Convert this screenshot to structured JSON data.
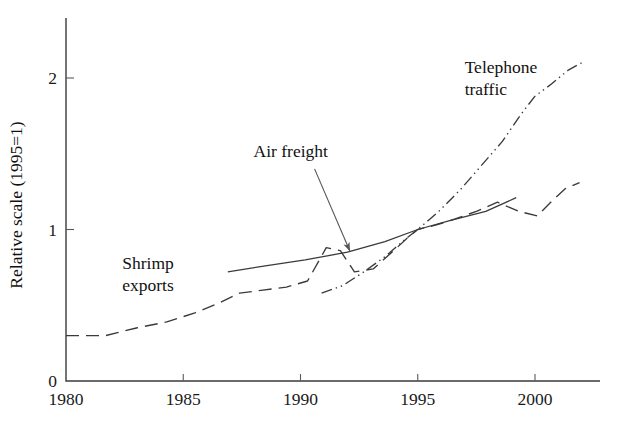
{
  "chart_data": {
    "type": "line",
    "title": "",
    "subtitle": "",
    "xlabel": "",
    "ylabel": "Relative scale (1995=1)",
    "xlim": [
      1980,
      2002.2
    ],
    "ylim": [
      0,
      2.3
    ],
    "x_ticks": [
      1980,
      1985,
      1990,
      1995,
      2000
    ],
    "x_tick_labels": [
      "1980",
      "1985",
      "1990",
      "1995",
      "2000"
    ],
    "y_ticks": [
      0,
      1,
      2
    ],
    "y_tick_labels": [
      "0",
      "1",
      "2"
    ],
    "grid": false,
    "legend_position": "inline-annotations",
    "series": [
      {
        "name": "Shrimp exports",
        "style": "dashed",
        "color": "#3a3a3a",
        "label_text": "Shrimp\nexports",
        "label_line1": "Shrimp",
        "label_line2": "exports",
        "label_x": 1982.4,
        "label_y": 0.74,
        "x": [
          1980.0,
          1981.7,
          1983.0,
          1984.3,
          1985.5,
          1986.6,
          1987.4,
          1988.4,
          1989.4,
          1990.3,
          1991.1,
          1991.7,
          1992.3,
          1993.1,
          1993.9,
          1994.6,
          1995.0,
          1995.8,
          1996.6,
          1997.5,
          1998.4,
          1999.3,
          2000.1,
          2000.8,
          2001.3,
          2001.9
        ],
        "y": [
          0.3,
          0.3,
          0.35,
          0.39,
          0.45,
          0.52,
          0.58,
          0.6,
          0.62,
          0.66,
          0.88,
          0.86,
          0.72,
          0.74,
          0.85,
          0.95,
          1.0,
          1.03,
          1.07,
          1.12,
          1.18,
          1.12,
          1.09,
          1.2,
          1.27,
          1.31
        ]
      },
      {
        "name": "Air freight",
        "style": "solid",
        "color": "#3a3a3a",
        "label_text": "Air freight",
        "label_x": 1988.0,
        "label_y": 1.48,
        "x": [
          1986.9,
          1988.5,
          1990.2,
          1992.0,
          1993.6,
          1995.0,
          1996.4,
          1997.9,
          1999.2
        ],
        "y": [
          0.72,
          0.76,
          0.8,
          0.85,
          0.92,
          1.0,
          1.06,
          1.12,
          1.21
        ]
      },
      {
        "name": "Telephone traffic",
        "style": "dash-dot-dot",
        "color": "#3a3a3a",
        "label_text": "Telephone\ntraffic",
        "label_line1": "Telephone",
        "label_line2": "traffic",
        "label_x": 1997.0,
        "label_y": 2.03,
        "x": [
          1990.9,
          1991.8,
          1992.7,
          1993.6,
          1994.5,
          1995.0,
          1995.9,
          1996.8,
          1997.7,
          1998.6,
          1999.4,
          2000.0,
          2000.7,
          2001.4,
          2002.1
        ],
        "y": [
          0.58,
          0.63,
          0.72,
          0.82,
          0.94,
          1.0,
          1.12,
          1.26,
          1.42,
          1.58,
          1.76,
          1.88,
          1.96,
          2.05,
          2.11
        ]
      }
    ],
    "annotations": [
      {
        "name": "air-freight-leader",
        "from_x": 1990.6,
        "from_y": 1.4,
        "to_x": 1992.1,
        "to_y": 0.86,
        "arrow": true
      }
    ],
    "axes_geometry": {
      "origin_px": [
        66,
        381
      ],
      "px_per_year": 23.45,
      "px_per_unit": 151.5,
      "plot_right_px": 600,
      "plot_top_px": 18
    }
  }
}
